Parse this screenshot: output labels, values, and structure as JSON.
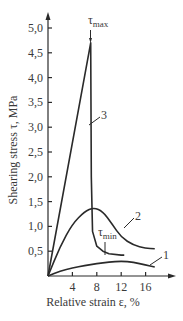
{
  "chart_data": {
    "type": "line",
    "title": "",
    "xlabel": "Relative strain ε, %",
    "ylabel": "Shearing stress τ, MPa",
    "x_ticks": [
      "4",
      "8",
      "12",
      "16"
    ],
    "y_ticks": [
      "0,5",
      "1,0",
      "1,5",
      "2,0",
      "2,5",
      "3,0",
      "3,5",
      "4,0",
      "4,5",
      "5,0"
    ],
    "xlim": [
      0,
      19
    ],
    "ylim": [
      0,
      5.2
    ],
    "grid": false,
    "legend": "none (curves labelled inline 1, 2, 3)",
    "annotations": [
      {
        "text": "τmax",
        "x": 7,
        "y": 4.7,
        "note": "arrow pointing to peak of curve 3"
      },
      {
        "text": "τmin",
        "x": 9.5,
        "y": 0.45,
        "note": "leader to residual plateau of curve 3"
      }
    ],
    "series": [
      {
        "name": "1",
        "x": [
          0,
          2,
          4,
          6,
          8,
          10,
          12,
          14,
          16,
          17.5
        ],
        "y": [
          0,
          0.1,
          0.16,
          0.21,
          0.25,
          0.28,
          0.3,
          0.28,
          0.22,
          0.18
        ]
      },
      {
        "name": "2",
        "x": [
          0,
          2,
          4,
          6,
          7.5,
          9,
          10.5,
          12,
          14,
          16,
          17.5
        ],
        "y": [
          0,
          0.6,
          1.05,
          1.3,
          1.38,
          1.3,
          1.05,
          0.78,
          0.62,
          0.56,
          0.55
        ]
      },
      {
        "name": "3",
        "x": [
          0,
          7,
          7.1,
          7.3,
          8,
          9,
          10,
          12,
          12.5
        ],
        "y": [
          0,
          4.7,
          2.0,
          0.9,
          0.6,
          0.5,
          0.45,
          0.42,
          0.42
        ]
      }
    ]
  },
  "labels": {
    "y_axis_title": "Shearing stress τ, MPa",
    "x_axis_title": "Relative strain ε, %",
    "tau_max": "τ",
    "tau_max_sub": "max",
    "tau_min": "τ",
    "tau_min_sub": "min",
    "curve_1": "1",
    "curve_2": "2",
    "curve_3": "3"
  }
}
